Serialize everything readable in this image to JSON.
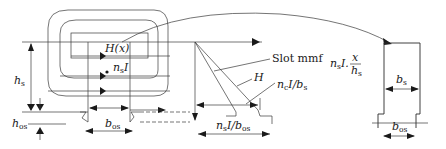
{
  "diagram": {
    "labels": {
      "field": "H(x)",
      "current_main": "n",
      "current_sub": "s",
      "current_tail": "I",
      "hs_main": "h",
      "hs_sub": "s",
      "hos_main": "h",
      "hos_sub": "os",
      "bos_main": "b",
      "bos_sub": "os",
      "slot_mmf": "Slot mmf",
      "H": "H",
      "ncI_bs_n": "n",
      "ncI_bs_nsub": "c",
      "ncI_bs_mid": "I/b",
      "ncI_bs_bsub": "s",
      "nsI_bos_n": "n",
      "nsI_bos_nsub": "s",
      "nsI_bos_mid": "I/b",
      "nsI_bos_bsub": "os",
      "formula_n": "n",
      "formula_nsub": "s",
      "formula_mid": "I.",
      "formula_num": "x",
      "formula_den": "h",
      "formula_densub": "s",
      "bs_main": "b",
      "bs_sub": "s",
      "bos2_main": "b",
      "bos2_sub": "os"
    }
  }
}
